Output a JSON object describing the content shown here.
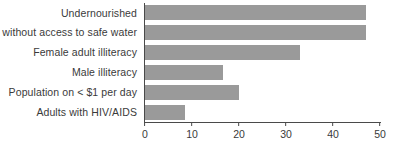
{
  "chart_data": {
    "type": "bar",
    "orientation": "horizontal",
    "title": "",
    "subtitle": "",
    "xlabel": "",
    "ylabel": "",
    "categories": [
      "Undernourished",
      "% without access to safe water",
      "Female adult illiteracy",
      "Male illiteracy",
      "Population on < $1 per day",
      "Adults with HIV/AIDS"
    ],
    "values": [
      47,
      47,
      33,
      16.5,
      20,
      8.5
    ],
    "series": [
      {
        "name": "",
        "values": [
          47,
          47,
          33,
          16.5,
          20,
          8.5
        ]
      }
    ],
    "xlim": [
      0,
      50
    ],
    "xticks": [
      0,
      10,
      20,
      30,
      40,
      50
    ],
    "xtick_labels": [
      "0",
      "10",
      "20",
      "30",
      "40",
      "50"
    ],
    "grid": false,
    "legend": false,
    "legend_position": "none",
    "bar_color": "#9a9a9a",
    "axis_color": "#4a4a4a",
    "text_color": "#3a3a3a",
    "background_color": "#ffffff"
  }
}
